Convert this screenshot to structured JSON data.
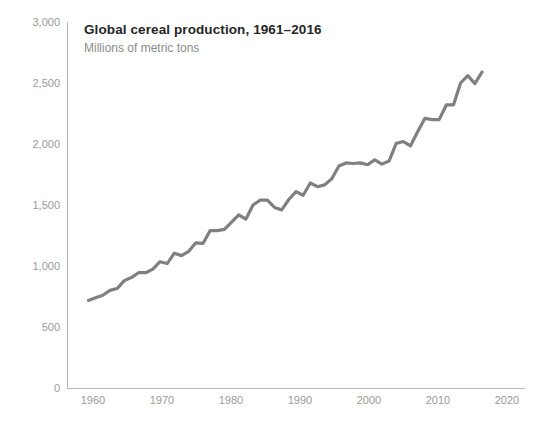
{
  "chart_data": {
    "type": "line",
    "title": "Global cereal production, 1961–2016",
    "subtitle": "Millions of metric tons",
    "xlabel": "",
    "ylabel": "",
    "xlim": [
      1958,
      2022
    ],
    "ylim": [
      0,
      3000
    ],
    "grid": false,
    "legend": false,
    "legend_position": "none",
    "line_color": "#808080",
    "axis_color": "#b5b5b5",
    "tick_label_color": "#9a9a9a",
    "title_color": "#262626",
    "subtitle_color": "#8c8c8c",
    "y_ticks": [
      0,
      500,
      1000,
      1500,
      2000,
      2500,
      3000
    ],
    "y_tick_labels": [
      "0",
      "500",
      "1,000",
      "1,500",
      "2,000",
      "2,500",
      "3,000"
    ],
    "x_ticks": [
      1960,
      1970,
      1980,
      1990,
      2000,
      2010,
      2020
    ],
    "x_tick_labels": [
      "1960",
      "1970",
      "1980",
      "1990",
      "2000",
      "2010",
      "2020"
    ],
    "series": [
      {
        "name": "Global cereal production",
        "x": [
          1961,
          1962,
          1963,
          1964,
          1965,
          1966,
          1967,
          1968,
          1969,
          1970,
          1971,
          1972,
          1973,
          1974,
          1975,
          1976,
          1977,
          1978,
          1979,
          1980,
          1981,
          1982,
          1983,
          1984,
          1985,
          1986,
          1987,
          1988,
          1989,
          1990,
          1991,
          1992,
          1993,
          1994,
          1995,
          1996,
          1997,
          1998,
          1999,
          2000,
          2001,
          2002,
          2003,
          2004,
          2005,
          2006,
          2007,
          2008,
          2009,
          2010,
          2011,
          2012,
          2013,
          2014,
          2015,
          2016
        ],
        "values": [
          718,
          740,
          760,
          800,
          815,
          880,
          905,
          945,
          945,
          975,
          1035,
          1020,
          1105,
          1085,
          1120,
          1190,
          1185,
          1290,
          1290,
          1300,
          1360,
          1420,
          1385,
          1500,
          1540,
          1540,
          1480,
          1460,
          1545,
          1610,
          1580,
          1680,
          1650,
          1665,
          1715,
          1820,
          1845,
          1840,
          1845,
          1830,
          1870,
          1835,
          1860,
          2005,
          2020,
          1985,
          2100,
          2210,
          2200,
          2200,
          2320,
          2320,
          2500,
          2560,
          2495,
          2590
        ]
      }
    ],
    "annotations": []
  },
  "geometry": {
    "plot_left": 67,
    "plot_right": 525,
    "plot_top": 22,
    "plot_bottom": 388,
    "x_year_min": 1958,
    "x_year_max": 2022,
    "y_value_min": 0,
    "y_value_max": 3000
  }
}
